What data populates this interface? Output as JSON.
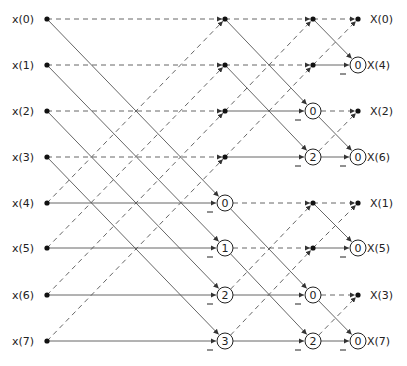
{
  "diagram": {
    "type": "fft-butterfly-decimation-in-frequency",
    "inputs": [
      "x(0)",
      "x(1)",
      "x(2)",
      "x(3)",
      "x(4)",
      "x(5)",
      "x(6)",
      "x(7)"
    ],
    "outputs": [
      "X(0)",
      "X(4)",
      "X(2)",
      "X(6)",
      "X(1)",
      "X(5)",
      "X(3)",
      "X(7)"
    ],
    "stage1_twiddles": [
      "",
      "",
      "",
      "",
      "0",
      "1",
      "2",
      "3"
    ],
    "stage2_twiddles": [
      "",
      "",
      "0",
      "2",
      "",
      "",
      "0",
      "2"
    ],
    "stage3_twiddles": [
      "",
      "0",
      "",
      "0",
      "",
      "0",
      "",
      "0"
    ],
    "legend": {
      "dashed_line": "addition path",
      "solid_line": "subtraction path",
      "circle": "twiddle factor multiplier",
      "minus_sign": "negation"
    }
  }
}
